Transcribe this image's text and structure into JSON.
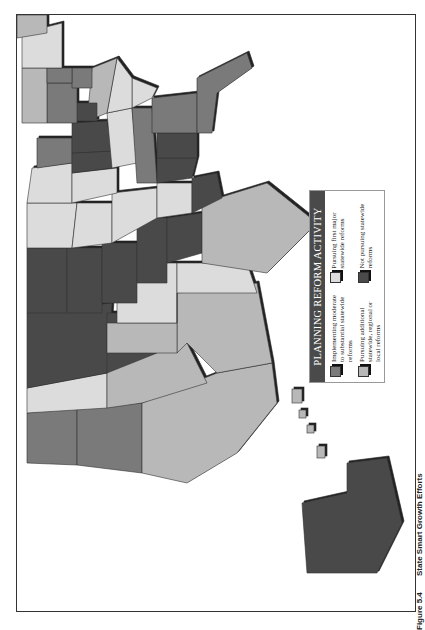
{
  "figure": {
    "label": "Figure 5.4",
    "title": "State Smart Growth Efforts",
    "orientation": "rotated 90° counter-clockwise (landscape on portrait page)"
  },
  "legend": {
    "title": "PLANNING REFORM ACTIVITY",
    "items": [
      {
        "label": "Implementing moderate to substantial statewide reforms",
        "color": "#7a7a7a"
      },
      {
        "label": "Pursuing first major statewide reforms",
        "color": "#dcdcdc"
      },
      {
        "label": "Pursuing additional statewide, regional or local reforms",
        "color": "#b8b8b8"
      },
      {
        "label": "Not pursuing statewide reforms",
        "color": "#4a4a4a"
      }
    ]
  },
  "colors": {
    "implementing": "#7a7a7a",
    "first_major": "#dcdcdc",
    "additional": "#b8b8b8",
    "not_pursuing": "#4a4a4a",
    "shadow": "#222222",
    "border": "#333333"
  }
}
